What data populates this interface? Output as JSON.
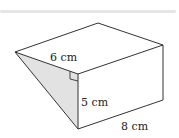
{
  "figure": {
    "type": "triangular-prism",
    "labels": {
      "slant_edge": "6 cm",
      "height": "5 cm",
      "length": "8 cm"
    },
    "shaded_face": "triangular end face",
    "right_angle_marker": true,
    "colors": {
      "line": "#333333",
      "shade": "#e2e2e2",
      "topbar": "#e6e6e6"
    }
  }
}
